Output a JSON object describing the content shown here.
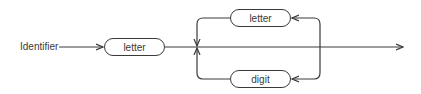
{
  "diagram": {
    "type": "syntax-diagram",
    "rule_name": "Identifier",
    "nodes": {
      "first": "letter",
      "loop_top": "letter",
      "loop_bottom": "digit"
    },
    "colors": {
      "stroke": "#3a3a3a",
      "background": "#ffffff"
    }
  }
}
